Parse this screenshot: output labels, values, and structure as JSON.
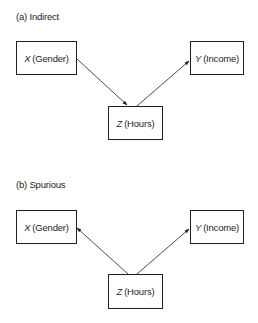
{
  "panels": [
    {
      "label": "(a) Indirect",
      "type": "indirect",
      "nodes": {
        "x": {
          "var": "X",
          "name": "(Gender)"
        },
        "y": {
          "var": "Y",
          "name": "(Income)"
        },
        "z": {
          "var": "Z",
          "name": "(Hours)"
        }
      },
      "edges": [
        {
          "from": "X (Gender)",
          "to": "Z (Hours)"
        },
        {
          "from": "Z (Hours)",
          "to": "Y (Income)"
        }
      ]
    },
    {
      "label": "(b) Spurious",
      "type": "spurious",
      "nodes": {
        "x": {
          "var": "X",
          "name": "(Gender)"
        },
        "y": {
          "var": "Y",
          "name": "(Income)"
        },
        "z": {
          "var": "Z",
          "name": "(Hours)"
        }
      },
      "edges": [
        {
          "from": "Z (Hours)",
          "to": "X (Gender)"
        },
        {
          "from": "Z (Hours)",
          "to": "Y (Income)"
        }
      ]
    }
  ]
}
